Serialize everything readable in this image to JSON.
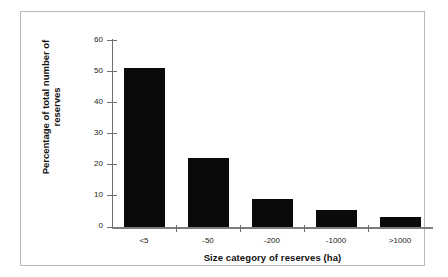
{
  "chart_data": {
    "type": "bar",
    "title": "",
    "categories": [
      "<5",
      "-50",
      "-200",
      "-1000",
      ">1000"
    ],
    "values": [
      51,
      22,
      9,
      5.3,
      3.3
    ],
    "series": [
      {
        "name": "Percentage of total number of reserves",
        "values": [
          51,
          22,
          9,
          5.3,
          3.3
        ]
      }
    ],
    "xlabel": "Size category of reserves (ha)",
    "ylabel": "Percentage of total number of reserves",
    "ylabel_line1": "Percentage of total number of",
    "ylabel_line2": "reserves",
    "ylim": [
      0,
      60
    ],
    "yticks": [
      0,
      10,
      20,
      30,
      40,
      50,
      60
    ],
    "ytick_labels": [
      "0",
      "10",
      "20",
      "30",
      "40",
      "50",
      "60"
    ],
    "grid": false,
    "legend": false,
    "legend_position": "none",
    "bar_color": "#0a0a0a",
    "axis_color": "#6f6f6f",
    "frame_color": "#b9b9b9",
    "background": "#ffffff"
  }
}
